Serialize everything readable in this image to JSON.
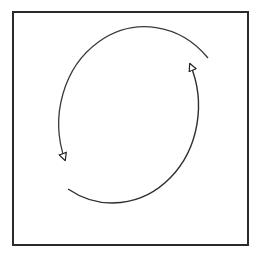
{
  "diagram": {
    "description": "Square frame containing two curved arrows forming a cycle (counterclockwise circulation)",
    "frame": {
      "x": 13,
      "y": 12,
      "width": 235,
      "height": 233,
      "stroke": "#222222",
      "stroke_width": 2
    },
    "cycle": {
      "center": [
        138,
        124
      ],
      "rx": 86,
      "ry": 97,
      "direction": "counterclockwise",
      "arrows": [
        {
          "name": "upper-left-arc",
          "start": [
            208,
            58
          ],
          "end": [
            65,
            160
          ],
          "path_via": "top and left side",
          "head": "open triangle pointing down-right"
        },
        {
          "name": "lower-right-arc",
          "start": [
            68,
            189
          ],
          "end": [
            190,
            64
          ],
          "path_via": "bottom and right side",
          "head": "open triangle pointing up-left"
        }
      ],
      "stroke": "#333333"
    },
    "labels": []
  }
}
